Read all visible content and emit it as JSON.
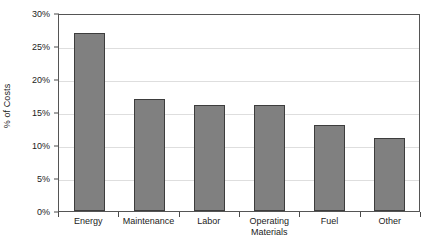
{
  "chart_data": {
    "type": "bar",
    "title": "",
    "xlabel": "",
    "ylabel": "% of Costs",
    "ylim": [
      0,
      30
    ],
    "yticks": [
      "0%",
      "5%",
      "10%",
      "15%",
      "20%",
      "25%",
      "30%"
    ],
    "ytick_values": [
      0,
      5,
      10,
      15,
      20,
      25,
      30
    ],
    "grid": true,
    "legend": "none",
    "categories": [
      "Energy",
      "Maintenance",
      "Labor",
      "Operating Materials",
      "Fuel",
      "Other"
    ],
    "category_lines": [
      [
        "Energy",
        ""
      ],
      [
        "Maintenance",
        ""
      ],
      [
        "Labor",
        ""
      ],
      [
        "Operating",
        "Materials"
      ],
      [
        "Fuel",
        ""
      ],
      [
        "Other",
        ""
      ]
    ],
    "values": [
      27,
      17,
      16,
      16,
      13,
      11
    ],
    "bar_color": "#808080",
    "bar_border_color": "#3d3d3d",
    "gridline_color": "#dedede",
    "axis_color": "#555555",
    "text_color": "#1c1c1c"
  }
}
